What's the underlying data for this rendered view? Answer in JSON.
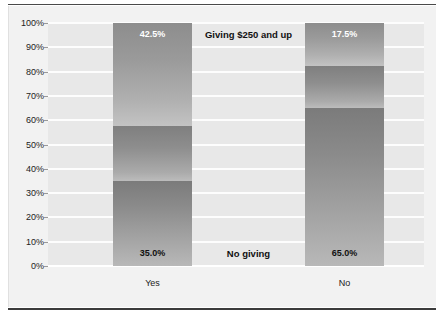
{
  "figure": {
    "background_color": "#f2f2f2",
    "plot_background_color": "#e8e8e8",
    "gridline_color": "#ffffff",
    "rule_color": "#3c3c3c"
  },
  "chart_data": {
    "type": "bar",
    "subtype": "stacked-100-percent",
    "title": "",
    "xlabel": "",
    "ylabel": "",
    "ylim": [
      0,
      100
    ],
    "ytick_labels": [
      "100%",
      "90%",
      "80%",
      "70%",
      "60%",
      "50%",
      "40%",
      "30%",
      "20%",
      "10%",
      "0%"
    ],
    "ytick_values": [
      100,
      90,
      80,
      70,
      60,
      50,
      40,
      30,
      20,
      10,
      0
    ],
    "grid": true,
    "legend_position": "inline-between-bars",
    "categories": [
      "Yes",
      "No"
    ],
    "series": [
      {
        "name": "No giving",
        "values": [
          35.0,
          65.0
        ],
        "value_labels": [
          "35.0%",
          "65.0%"
        ],
        "label_color": "#111111"
      },
      {
        "name": "",
        "values": [
          22.5,
          17.5
        ],
        "value_labels": [
          "",
          ""
        ],
        "label_color": "#111111"
      },
      {
        "name": "Giving $250 and up",
        "values": [
          42.5,
          17.5
        ],
        "value_labels": [
          "42.5%",
          "17.5%"
        ],
        "label_color": "#ffffff"
      }
    ],
    "inline_legend": [
      {
        "text": "Giving $250 and up",
        "series": "Giving $250 and up"
      },
      {
        "text": "No giving",
        "series": "No giving"
      }
    ]
  }
}
